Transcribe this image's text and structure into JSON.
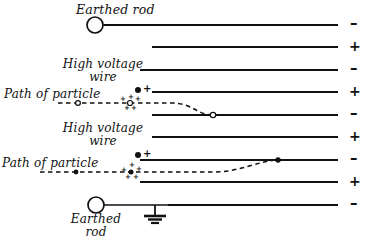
{
  "figure": {
    "type": "physics-schematic",
    "title_visible": false,
    "background": "#ffffff",
    "ink": "#111111",
    "width": 380,
    "height": 244
  },
  "labels": {
    "earthed_rod_top": "Earthed rod",
    "earthed_rod_bottom_line1": "Earthed",
    "earthed_rod_bottom_line2": "rod",
    "high_voltage_wire_1_line1": "High voltage",
    "high_voltage_wire_1_line2": "wire",
    "high_voltage_wire_2_line1": "High voltage",
    "high_voltage_wire_2_line2": "wire",
    "path_of_particle_1": "Path of particle",
    "path_of_particle_2": "Path of particle"
  },
  "electrodes": [
    {
      "index": 1,
      "y": 25,
      "x_start": 104,
      "x_end": 338,
      "polarity": "–"
    },
    {
      "index": 2,
      "y": 47,
      "x_start": 152,
      "x_end": 338,
      "polarity": "+"
    },
    {
      "index": 3,
      "y": 70,
      "x_start": 140,
      "x_end": 338,
      "polarity": "–"
    },
    {
      "index": 4,
      "y": 92,
      "x_start": 152,
      "x_end": 338,
      "polarity": "+"
    },
    {
      "index": 5,
      "y": 115,
      "x_start": 152,
      "x_end": 338,
      "polarity": "–"
    },
    {
      "index": 6,
      "y": 137,
      "x_start": 152,
      "x_end": 338,
      "polarity": "+"
    },
    {
      "index": 7,
      "y": 160,
      "x_start": 140,
      "x_end": 338,
      "polarity": "–"
    },
    {
      "index": 8,
      "y": 182,
      "x_start": 140,
      "x_end": 338,
      "polarity": "+"
    },
    {
      "index": 9,
      "y": 205,
      "x_start": 168,
      "x_end": 338,
      "polarity": "–"
    }
  ],
  "polarity_column": {
    "x": 352,
    "signs": [
      "–",
      "+",
      "–",
      "+",
      "–",
      "+",
      "–",
      "+",
      "–"
    ]
  },
  "wire_markers": [
    {
      "name": "high-voltage-wire-1",
      "x": 138,
      "y": 90,
      "dot": "filled",
      "sign": "+"
    },
    {
      "name": "high-voltage-wire-2",
      "x": 138,
      "y": 155,
      "dot": "filled",
      "sign": "+"
    }
  ],
  "particle_paths": [
    {
      "name": "path-of-particle-1",
      "style": "dashed",
      "start_x": 58,
      "start_y": 103,
      "entry_marker": {
        "x": 78,
        "y": 103,
        "shape": "open-circle"
      },
      "charge_cluster_x": 130,
      "end_marker": {
        "x": 213,
        "y": 115,
        "shape": "open-circle"
      },
      "curve_direction": "down"
    },
    {
      "name": "path-of-particle-2",
      "style": "dashed",
      "start_x": 40,
      "start_y": 172,
      "entry_marker": {
        "x": 76,
        "y": 172,
        "shape": "filled-dot"
      },
      "charge_cluster_x": 130,
      "end_marker": {
        "x": 278,
        "y": 160,
        "shape": "filled-dot"
      },
      "curve_direction": "up"
    }
  ],
  "charge_clusters": [
    {
      "name": "charge-cluster-1",
      "center_x": 130,
      "center_y": 103,
      "core": "open-circle",
      "signs": [
        {
          "glyph": "+",
          "dx": -8,
          "dy": -4
        },
        {
          "glyph": "+",
          "dx": 0,
          "dy": -6
        },
        {
          "glyph": "+",
          "dx": 7,
          "dy": -4
        },
        {
          "glyph": "+",
          "dx": -4,
          "dy": 5
        },
        {
          "glyph": "+",
          "dx": 3,
          "dy": 5
        }
      ]
    },
    {
      "name": "charge-cluster-2",
      "center_x": 131,
      "center_y": 172,
      "core": "filled-dot",
      "signs": [
        {
          "glyph": "+",
          "dx": -8,
          "dy": -2
        },
        {
          "glyph": "+",
          "dx": 0,
          "dy": -7
        },
        {
          "glyph": "+",
          "dx": 7,
          "dy": -3
        },
        {
          "glyph": "+",
          "dx": -4,
          "dy": 5
        },
        {
          "glyph": "+",
          "dx": 4,
          "dy": 5
        }
      ]
    }
  ],
  "earthed_rods": [
    {
      "name": "earthed-rod-top",
      "circle": {
        "cx": 95,
        "cy": 25,
        "r": 8
      },
      "lead": {
        "x1": 103,
        "y1": 25,
        "x2": 338,
        "y2": 25
      },
      "ground_symbol": false
    },
    {
      "name": "earthed-rod-bottom",
      "circle": {
        "cx": 96,
        "cy": 205,
        "r": 8
      },
      "lead": {
        "x1": 104,
        "y1": 205,
        "x2": 338,
        "y2": 205
      },
      "ground_symbol": true,
      "ground": {
        "x": 155,
        "y_top": 205,
        "y_bottom": 224
      }
    }
  ]
}
